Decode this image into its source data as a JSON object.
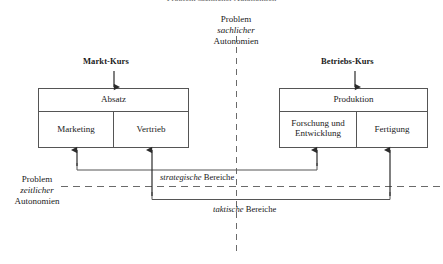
{
  "diagram": {
    "clipped_top_text": "Problem sachlicher Autonomien",
    "vertical_axis": {
      "line1": "Problem",
      "line2": "sachlicher",
      "line3": "Autonomien"
    },
    "horizontal_axis": {
      "line1": "Problem",
      "line2": "zeitlicher",
      "line3": "Autonomien"
    },
    "left_group": {
      "kurs_label": "Markt-Kurs",
      "header_box": "Absatz",
      "sub_boxes": [
        "Marketing",
        "Vertrieb"
      ]
    },
    "right_group": {
      "kurs_label": "Betriebs-Kurs",
      "header_box": "Produktion",
      "sub_boxes": [
        "Forschung und Entwicklung",
        "Fertigung"
      ]
    },
    "brackets": {
      "strategic": {
        "emphasis": "strategische",
        "text": "Bereiche"
      },
      "tactical": {
        "emphasis": "taktische",
        "text": "Bereiche"
      }
    },
    "colors": {
      "stroke": "#4a4a4a",
      "text": "#1a1a1a",
      "background": "#ffffff"
    }
  }
}
